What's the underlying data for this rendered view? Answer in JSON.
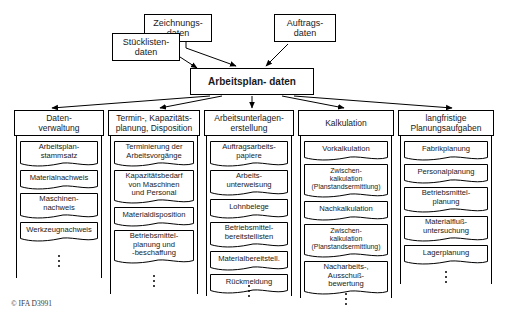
{
  "figure": {
    "footer_credit": "© IFA D3991"
  },
  "sources": [
    {
      "id": "zeichnungsdaten",
      "label": "Zeichnungs-\ndaten"
    },
    {
      "id": "stuecklistendaten",
      "label": "Stücklisten-\ndaten"
    },
    {
      "id": "auftragsdaten",
      "label": "Auftrags-\ndaten"
    }
  ],
  "hub": {
    "label": "Arbeitsplan-\ndaten"
  },
  "columns": [
    {
      "id": "datenverwaltung",
      "header": "Daten-\nverwaltung",
      "items": [
        "Arbeitsplan-\nstammsatz",
        "Materialnachweis",
        "Maschinen-\nnachweis",
        "Werkzeugnachweis"
      ],
      "more": "⋮"
    },
    {
      "id": "termin-kapazitaetsplanung",
      "header": "Termin-, Kapazitäts-\nplanung, Disposition",
      "items": [
        "Terminierung der\nArbeitsvorgänge",
        "Kapazitätsbedarf\nvon Maschinen\nund Personal",
        "Materialdisposition",
        "Betriebsmittel-\nplanung und\n-beschaffung"
      ],
      "more": "⋮"
    },
    {
      "id": "arbeitsunterlagenerstellung",
      "header": "Arbeitsunterlagen-\nerstellung",
      "items": [
        "Auftragsarbeits-\npapiere",
        "Arbeits-\nunterweisung",
        "Lohnbelege",
        "Betriebsmittel-\nbereitstellisten",
        "Materialbereitstell.",
        "Rückmeldung"
      ],
      "more": "⋮"
    },
    {
      "id": "kalkulation",
      "header": "Kalkulation",
      "items": [
        "Vorkalkulation",
        "Zwischen-\nkalkulation\n(Planstandsermittlung)",
        "Nachkalkulation",
        "Zwischen-\nkalkulation\n(Planstandsermittlung)",
        "Nacharbeits-,\nAusschuß-\nbewertung"
      ],
      "more": "⋮"
    },
    {
      "id": "langfristige-planungsaufgaben",
      "header": "langfristige\nPlanungsaufgaben",
      "items": [
        "Fabrikplanung",
        "Personalplanung",
        "Betriebsmittel-\nplanung",
        "Materialfluß-\nuntersuchung",
        "Lagerplanung"
      ],
      "more": "⋮"
    }
  ]
}
